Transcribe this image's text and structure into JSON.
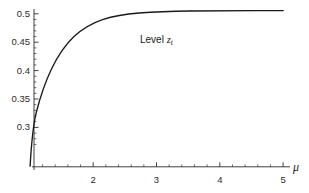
{
  "chart_data": {
    "type": "line",
    "title": "",
    "subtitle": "",
    "xlabel": "μ",
    "ylabel": "",
    "xlim": [
      0.79,
      5.25
    ],
    "ylim": [
      0.2575,
      0.5075
    ],
    "grid": false,
    "legend_position": "none",
    "annotations": [
      {
        "name": "level-curve-label",
        "text_prefix": "Level ",
        "variable": "z",
        "subscript": "t",
        "x": 2.82,
        "y": 0.4735
      }
    ],
    "axes": {
      "x": {
        "label": "μ",
        "tick_labels": [
          "2",
          "3",
          "4",
          "5"
        ],
        "tick_values": [
          2,
          3,
          4,
          5
        ],
        "minor_tick_values": [
          1.2,
          1.4,
          1.6,
          1.8,
          2.2,
          2.4,
          2.6,
          2.8,
          3.2,
          3.4,
          3.6,
          3.8,
          4.2,
          4.4,
          4.6,
          4.8
        ],
        "axis_start": 0.94,
        "axis_end": 5.18
      },
      "y": {
        "label": "",
        "tick_labels": [
          "0.3",
          "0.35",
          "0.4",
          "0.45",
          "0.5"
        ],
        "tick_values": [
          0.3,
          0.35,
          0.4,
          0.45,
          0.5
        ],
        "minor_tick_values": [
          0.27,
          0.28,
          0.29,
          0.31,
          0.32,
          0.33,
          0.34,
          0.36,
          0.37,
          0.38,
          0.39,
          0.41,
          0.42,
          0.43,
          0.44,
          0.46,
          0.47,
          0.48,
          0.49
        ],
        "axis_start": 0.2625,
        "axis_end": 0.5035
      }
    },
    "series": [
      {
        "name": "level-z-t",
        "color": "#1a1a1a",
        "x": [
          1.0,
          1.05,
          1.1,
          1.15,
          1.2,
          1.25,
          1.3,
          1.35,
          1.4,
          1.45,
          1.5,
          1.55,
          1.6,
          1.65,
          1.7,
          1.75,
          1.8,
          1.85,
          1.9,
          1.95,
          2.0,
          2.1,
          2.2,
          2.3,
          2.4,
          2.5,
          2.6,
          2.7,
          2.8,
          2.9,
          3.0,
          3.2,
          3.4,
          3.6,
          3.8,
          4.0,
          4.2,
          4.4,
          4.6,
          4.8,
          5.0
        ],
        "y": [
          0.27,
          0.2768,
          0.2833,
          0.2895,
          0.2954,
          0.3012,
          0.3067,
          0.312,
          0.3171,
          0.322,
          0.3267,
          0.3313,
          0.3357,
          0.3399,
          0.344,
          0.348,
          0.3518,
          0.3555,
          0.359,
          0.3625,
          0.3658,
          0.3721,
          0.378,
          0.3835,
          0.3886,
          0.3934,
          0.3979,
          0.4021,
          0.406,
          0.4097,
          0.4132,
          0.4196,
          0.4252,
          0.4302,
          0.4347,
          0.4386,
          0.4422,
          0.4454,
          0.4483,
          0.4509,
          0.4533
        ]
      }
    ]
  },
  "rendering": {
    "curve_path": "M 30.1,166.2 C 31.6,140.0 33.8,122.0 36.4,112.0 C 41.0,94.0 46.0,80.5 51.5,69.0 C 58.5,54.5 66.0,44.0 74.0,36.5 C 83.0,28.2 92.5,23.0 102.5,19.6 C 114.0,15.9 126.0,14.0 139.0,13.0 C 155.0,11.9 172.0,11.3 190.0,11.0 C 210.0,10.8 232.0,10.7 255.0,10.6 C 266.0,10.6 275.0,10.6 283.2,10.6",
    "stroke_width": 1.35,
    "stroke_color": "#1a1a1a",
    "axis_color": "#2b2b2b",
    "axis_width": 0.9,
    "background": "#ffffff"
  },
  "layout": {
    "y_ticks_px": [
      {
        "label": "0.5",
        "y": 13.8
      },
      {
        "label": "0.45",
        "y": 42.2
      },
      {
        "label": "0.4",
        "y": 70.6
      },
      {
        "label": "0.35",
        "y": 99.0
      },
      {
        "label": "0.3",
        "y": 127.4
      }
    ],
    "x_ticks_px": [
      {
        "label": "2",
        "x": 93.2
      },
      {
        "label": "3",
        "x": 156.5
      },
      {
        "label": "4",
        "x": 219.8
      },
      {
        "label": "5",
        "x": 283.1
      }
    ],
    "mu_symbol": {
      "x": 293.0,
      "y": 160.5
    },
    "annotation": {
      "x": 140.0,
      "y": 35.0
    }
  }
}
